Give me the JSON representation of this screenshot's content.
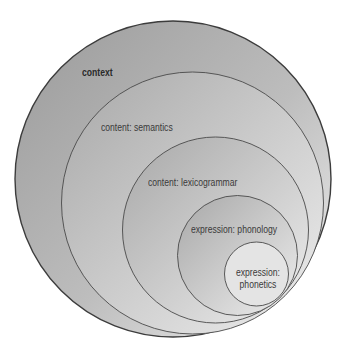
{
  "diagram": {
    "type": "nested-circles",
    "layers": [
      {
        "label": "context",
        "bold": true
      },
      {
        "label": "content: semantics",
        "bold": false
      },
      {
        "label": "content: lexicogrammar",
        "bold": false
      },
      {
        "label": "expression: phonology",
        "bold": false
      },
      {
        "label": "expression: phonetics",
        "lines": [
          "expression:",
          "phonetics"
        ],
        "bold": false
      }
    ],
    "colors": {
      "fill_dark": "#a0a0a0",
      "fill_light": "#ececec",
      "stroke": "#4a4a4a",
      "text": "#3a3a3a"
    }
  }
}
